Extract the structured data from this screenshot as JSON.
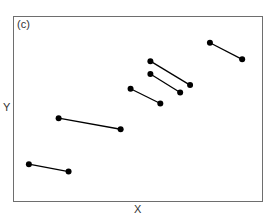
{
  "chart_data": {
    "type": "scatter",
    "title": "",
    "panel_label": "(c)",
    "xlabel": "X",
    "ylabel": "Y",
    "grid": false,
    "legend": null,
    "xlim": [
      0,
      100
    ],
    "ylim": [
      0,
      100
    ],
    "ticks": "none",
    "style": {
      "marker_color": "#000000",
      "line_color": "#000000",
      "frame_color": "#6e6e6e"
    },
    "series": [
      {
        "name": "segment-1",
        "x": [
          6,
          22
        ],
        "y": [
          20,
          16
        ]
      },
      {
        "name": "segment-2",
        "x": [
          18,
          43
        ],
        "y": [
          45,
          39
        ]
      },
      {
        "name": "segment-3",
        "x": [
          47,
          59
        ],
        "y": [
          61,
          53
        ]
      },
      {
        "name": "segment-4",
        "x": [
          55,
          67
        ],
        "y": [
          69,
          59
        ]
      },
      {
        "name": "segment-5",
        "x": [
          55,
          71
        ],
        "y": [
          76,
          63
        ]
      },
      {
        "name": "segment-6",
        "x": [
          79,
          92
        ],
        "y": [
          86,
          77
        ]
      }
    ]
  }
}
